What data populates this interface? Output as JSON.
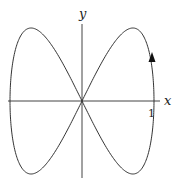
{
  "diagram": {
    "type": "parametric-curve",
    "axes": {
      "x_label": "x",
      "y_label": "y",
      "x_tick_label": "1"
    },
    "curve": {
      "x_expr": "sin(t)",
      "y_expr": "sin(2t)",
      "direction_arrow": "up, on right lobe",
      "stroke_color": "#333333"
    }
  }
}
